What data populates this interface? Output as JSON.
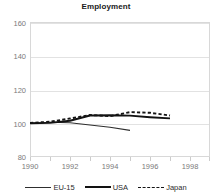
{
  "chart_data": {
    "type": "line",
    "title": "Employment",
    "xlabel": "",
    "ylabel": "",
    "xlim": [
      1990,
      1999
    ],
    "ylim": [
      80,
      160
    ],
    "ytick_labels": [
      "160",
      "140",
      "120",
      "100",
      "80"
    ],
    "yticks": [
      160,
      140,
      120,
      100,
      80
    ],
    "xtick_labels": [
      "1990",
      "1992",
      "1994",
      "1996",
      "1998"
    ],
    "xticks": [
      1990,
      1992,
      1994,
      1996,
      1998
    ],
    "grid": true,
    "legend_position": "bottom",
    "series": [
      {
        "name": "EU-15",
        "style": "solid-thin",
        "color": "#2e2e2e",
        "x": [
          1990,
          1991,
          1992,
          1993,
          1994,
          1995
        ],
        "values": [
          100.0,
          100.6,
          100.3,
          99.0,
          97.6,
          95.8
        ]
      },
      {
        "name": "USA",
        "style": "solid-thick",
        "color": "#121212",
        "x": [
          1990,
          1991,
          1992,
          1993,
          1994,
          1995,
          1996,
          1997
        ],
        "values": [
          100.0,
          100.2,
          101.5,
          104.6,
          104.7,
          104.5,
          103.6,
          102.9
        ]
      },
      {
        "name": "Japan",
        "style": "dashed",
        "color": "#141414",
        "x": [
          1990,
          1991,
          1992,
          1993,
          1994,
          1995,
          1996,
          1997
        ],
        "values": [
          100.2,
          100.9,
          102.8,
          104.9,
          104.2,
          106.6,
          106.2,
          104.6
        ]
      }
    ]
  },
  "legend": {
    "items": [
      {
        "label": "EU-15"
      },
      {
        "label": "USA"
      },
      {
        "label": "Japan"
      }
    ]
  },
  "axis": {
    "y": {
      "t0": "160",
      "t1": "140",
      "t2": "120",
      "t3": "100",
      "t4": "80"
    },
    "x": {
      "t0": "1990",
      "t1": "1992",
      "t2": "1994",
      "t3": "1996",
      "t4": "1998"
    }
  },
  "colors": {
    "grid": "#e2e2e2",
    "frame": "#d8d8d8",
    "tick_text": "#7a7a7a",
    "title_text": "#1a1a1a"
  }
}
